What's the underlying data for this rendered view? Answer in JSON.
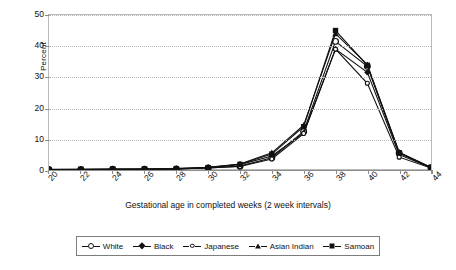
{
  "chart_data": {
    "type": "line",
    "title": "",
    "xlabel": "Gestational age in completed weeks (2 week intervals)",
    "ylabel": "Percent",
    "categories": [
      "20",
      "22",
      "24",
      "26",
      "28",
      "30",
      "32",
      "34",
      "36",
      "38",
      "40",
      "42",
      "44"
    ],
    "x": [
      20,
      22,
      24,
      26,
      28,
      30,
      32,
      34,
      36,
      38,
      40,
      42,
      44
    ],
    "ylim": [
      0,
      50
    ],
    "xlim": [
      20,
      44
    ],
    "yticks": [
      "0",
      "10",
      "20",
      "30",
      "40",
      "50"
    ],
    "grid": "horizontal-dotted",
    "legend_position": "bottom",
    "series": [
      {
        "name": "White",
        "marker": "open-circle",
        "values": [
          0.2,
          0.2,
          0.3,
          0.3,
          0.4,
          0.7,
          1.3,
          4.0,
          12.5,
          41.5,
          33.5,
          5.5,
          0.8
        ]
      },
      {
        "name": "Black",
        "marker": "filled-diamond",
        "values": [
          0.3,
          0.3,
          0.4,
          0.4,
          0.5,
          0.9,
          1.8,
          4.6,
          12.0,
          39.0,
          31.5,
          5.0,
          0.8
        ]
      },
      {
        "name": "Japanese",
        "marker": "small-open-circle",
        "values": [
          0.2,
          0.2,
          0.2,
          0.3,
          0.4,
          0.7,
          1.2,
          3.6,
          11.8,
          39.0,
          28.0,
          4.2,
          0.7
        ]
      },
      {
        "name": "Asian Indian",
        "marker": "filled-triangle",
        "values": [
          0.2,
          0.3,
          0.3,
          0.4,
          0.5,
          0.9,
          2.0,
          5.6,
          14.5,
          44.0,
          34.0,
          5.8,
          0.9
        ]
      },
      {
        "name": "Samoan",
        "marker": "filled-square",
        "values": [
          0.2,
          0.2,
          0.3,
          0.3,
          0.4,
          0.8,
          1.9,
          5.2,
          14.0,
          45.0,
          33.8,
          5.6,
          0.9
        ]
      }
    ]
  },
  "axis": {
    "y_label": "Percent",
    "x_title": "Gestational age in completed weeks (2 week intervals)",
    "y_ticks": [
      "0",
      "10",
      "20",
      "30",
      "40",
      "50"
    ],
    "x_ticks": [
      "20",
      "22",
      "24",
      "26",
      "28",
      "30",
      "32",
      "34",
      "36",
      "38",
      "40",
      "42",
      "44"
    ]
  },
  "legend": {
    "items": [
      {
        "label": "White"
      },
      {
        "label": "Black"
      },
      {
        "label": "Japanese"
      },
      {
        "label": "Asian Indian"
      },
      {
        "label": "Samoan"
      }
    ]
  },
  "colors": {
    "series": "#111111",
    "grid": "#b5b5b5",
    "frame": "#b9b9b9",
    "axis": "#8d8d8d",
    "background": "#ffffff"
  }
}
